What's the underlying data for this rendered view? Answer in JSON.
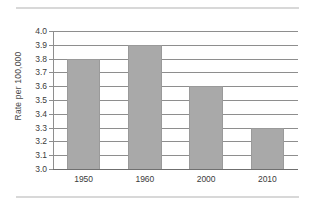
{
  "chart_data": {
    "type": "bar",
    "title": "",
    "subtitle": "",
    "xlabel": "",
    "ylabel": "Rate per 100,000",
    "categories": [
      "1950",
      "1960",
      "2000",
      "2010"
    ],
    "values": [
      3.8,
      3.9,
      3.6,
      3.3
    ],
    "series": [
      {
        "name": "Rate per 100,000",
        "values": [
          3.8,
          3.9,
          3.6,
          3.3
        ]
      }
    ],
    "ylim": [
      3.0,
      4.0
    ],
    "ytick_step": 0.1,
    "ytick_labels": [
      "4.0",
      "3.9",
      "3.8",
      "3.7",
      "3.6",
      "3.5",
      "3.4",
      "3.3",
      "3.2",
      "3.1",
      "3.0"
    ],
    "ytick_values": [
      4.0,
      3.9,
      3.8,
      3.7,
      3.6,
      3.5,
      3.4,
      3.3,
      3.2,
      3.1,
      3.0
    ],
    "grid": true,
    "grid_axis": "y",
    "legend": false,
    "legend_position": "none",
    "bar_color": "#a9a9a9",
    "bar_edge_color": "#9a9a9a",
    "grid_color": "#8e8e8e",
    "axis_color": "#6f6f6f",
    "background_color": "#ffffff",
    "annotations": []
  },
  "page": {
    "rule_color": "#d8d8d8"
  }
}
